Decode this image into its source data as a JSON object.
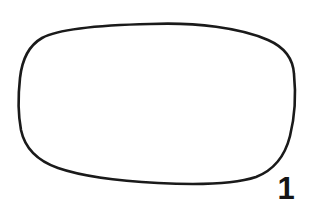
{
  "figure": {
    "label": "1",
    "background_color": "#ffffff",
    "stroke_color": "#1a1a1a",
    "stroke_width": 2.6,
    "shape_name": "rounded-lens-outline",
    "fill_color": "#ffffff",
    "bounds": {
      "left": 19,
      "top": 23,
      "right": 295,
      "bottom": 184
    },
    "label_color": "#141414",
    "label_position": {
      "x": 284,
      "y": 188
    }
  }
}
